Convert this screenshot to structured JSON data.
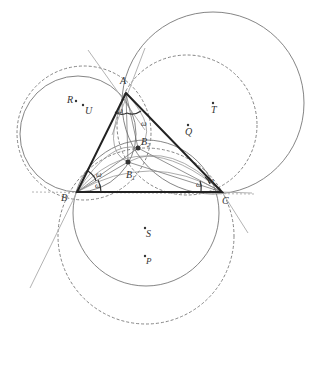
{
  "diagram": {
    "points": {
      "A": {
        "label": "A",
        "x": 126,
        "y": 93
      },
      "B": {
        "label": "B",
        "x": 77,
        "y": 192
      },
      "C": {
        "label": "C",
        "x": 222,
        "y": 192
      },
      "B1": {
        "label": "B",
        "sub": "1",
        "x": 128,
        "y": 162
      },
      "B2": {
        "label": "B",
        "sub": "2",
        "x": 138,
        "y": 148
      }
    },
    "centers": [
      {
        "label": "R",
        "x": 76,
        "y": 101
      },
      {
        "label": "U",
        "x": 83,
        "y": 105
      },
      {
        "label": "Q",
        "x": 188,
        "y": 125
      },
      {
        "label": "T",
        "x": 213,
        "y": 103
      },
      {
        "label": "S",
        "x": 145,
        "y": 228
      },
      {
        "label": "P",
        "x": 145,
        "y": 256
      }
    ],
    "angle_label": "ω"
  }
}
